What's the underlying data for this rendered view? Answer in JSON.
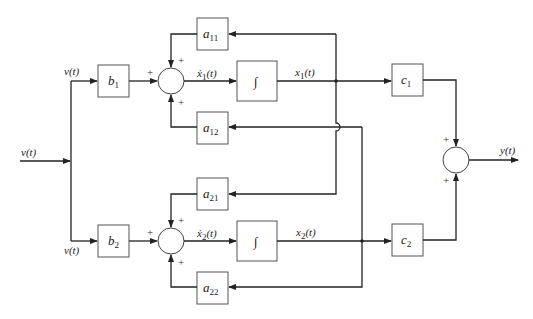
{
  "diagram": {
    "type": "state-space block diagram",
    "input_label": "v(t)",
    "branch_top_label": "v(t)",
    "branch_bottom_label": "v(t)",
    "output_label": "y(t)",
    "blocks": {
      "b1": {
        "name": "b",
        "sub": "1"
      },
      "b2": {
        "name": "b",
        "sub": "2"
      },
      "a11": {
        "name": "a",
        "sub": "11"
      },
      "a12": {
        "name": "a",
        "sub": "12"
      },
      "a21": {
        "name": "a",
        "sub": "21"
      },
      "a22": {
        "name": "a",
        "sub": "22"
      },
      "c1": {
        "name": "c",
        "sub": "1"
      },
      "c2": {
        "name": "c",
        "sub": "2"
      },
      "int1": {
        "symbol": "∫"
      },
      "int2": {
        "symbol": "∫"
      }
    },
    "signals": {
      "x1dot": {
        "name": "ẋ",
        "sub": "1",
        "arg": "(t)"
      },
      "x2dot": {
        "name": "ẋ",
        "sub": "2",
        "arg": "(t)"
      },
      "x1": {
        "name": "x",
        "sub": "1",
        "arg": "(t)"
      },
      "x2": {
        "name": "x",
        "sub": "2",
        "arg": "(t)"
      }
    },
    "signs": {
      "plus": "+"
    }
  }
}
